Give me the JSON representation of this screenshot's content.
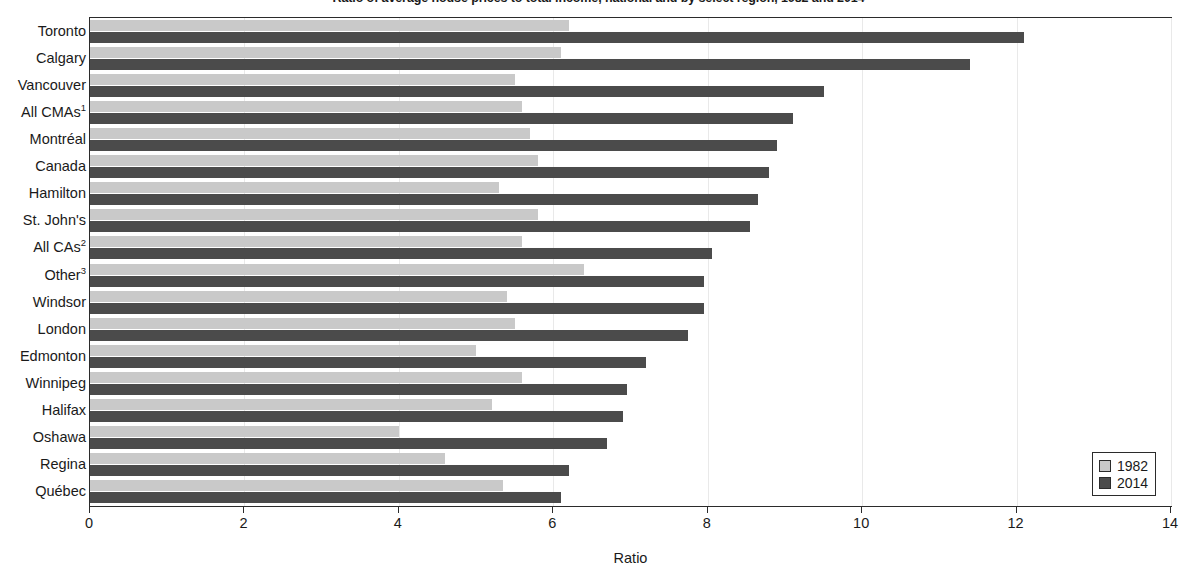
{
  "chart_data": {
    "type": "bar",
    "orientation": "horizontal",
    "title": "Ratio of average house prices to total income, national and by select region, 1982 and 2014",
    "xlabel": "Ratio",
    "ylabel": "",
    "xlim": [
      0,
      14
    ],
    "xticks": [
      0,
      2,
      4,
      6,
      8,
      10,
      12,
      14
    ],
    "xtick_labels": [
      "0",
      "2",
      "4",
      "6",
      "8",
      "10",
      "12",
      "14"
    ],
    "grid": false,
    "legend_position": "bottom-right",
    "categories": [
      "Toronto",
      "Calgary",
      "Vancouver",
      "All CMAs",
      "Montréal",
      "Canada",
      "Hamilton",
      "St. John's",
      "All CAs",
      "Other",
      "Windsor",
      "London",
      "Edmonton",
      "Winnipeg",
      "Halifax",
      "Oshawa",
      "Regina",
      "Québec"
    ],
    "category_footnotes": [
      "",
      "",
      "",
      "1",
      "",
      "",
      "",
      "",
      "2",
      "3",
      "",
      "",
      "",
      "",
      "",
      "",
      "",
      ""
    ],
    "series": [
      {
        "name": "1982",
        "color": "#c9c9c9",
        "values": [
          6.2,
          6.1,
          5.5,
          5.6,
          5.7,
          5.8,
          5.3,
          5.8,
          5.6,
          6.4,
          5.4,
          5.5,
          5.0,
          5.6,
          5.2,
          4.0,
          4.6,
          5.35
        ]
      },
      {
        "name": "2014",
        "color": "#4b4b4b",
        "values": [
          12.1,
          11.4,
          9.5,
          9.1,
          8.9,
          8.8,
          8.65,
          8.55,
          8.05,
          7.95,
          7.95,
          7.75,
          7.2,
          6.95,
          6.9,
          6.7,
          6.2,
          6.1
        ]
      }
    ]
  },
  "legend": {
    "items": [
      {
        "label": "1982",
        "swatch_class": "s1982"
      },
      {
        "label": "2014",
        "swatch_class": "s2014"
      }
    ]
  }
}
